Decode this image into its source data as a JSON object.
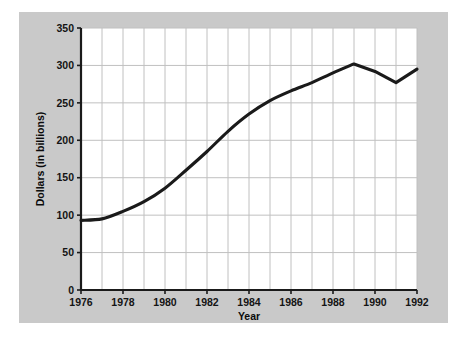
{
  "chart_data": {
    "type": "line",
    "title": "",
    "subtitle": "",
    "xlabel": "Year",
    "ylabel": "Dollars (in billions)",
    "xlim": [
      1976,
      1992
    ],
    "ylim": [
      0,
      350
    ],
    "grid": true,
    "legend": false,
    "x": [
      1976,
      1977,
      1978,
      1979,
      1980,
      1981,
      1982,
      1983,
      1984,
      1985,
      1986,
      1987,
      1988,
      1989,
      1990,
      1991,
      1992
    ],
    "series": [
      {
        "name": "Dollars (in billions)",
        "color": "#1a1a1a",
        "values": [
          93,
          95,
          105,
          118,
          136,
          160,
          185,
          212,
          235,
          253,
          266,
          277,
          290,
          302,
          292,
          277,
          295
        ]
      }
    ],
    "x_tick_labels": [
      "1976",
      "1978",
      "1980",
      "1982",
      "1984",
      "1986",
      "1988",
      "1990",
      "1992"
    ],
    "x_tick_values": [
      1976,
      1978,
      1980,
      1982,
      1984,
      1986,
      1988,
      1990,
      1992
    ],
    "x_gridline_step": 1,
    "y_tick_labels": [
      "0",
      "50",
      "100",
      "150",
      "200",
      "250",
      "300",
      "350"
    ],
    "y_tick_values": [
      0,
      50,
      100,
      150,
      200,
      250,
      300,
      350
    ],
    "colors": {
      "figure_background": "#ffffff",
      "panel_background": "#c9c9c9",
      "plot_background": "#ffffff",
      "gridline": "#c0c0c0",
      "axis_line": "#1a1a1a",
      "line": "#1a1a1a",
      "text": "#111111"
    }
  }
}
